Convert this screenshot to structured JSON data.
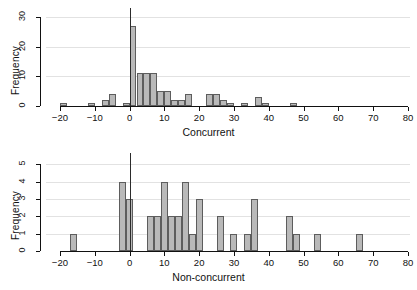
{
  "figure": {
    "title": "",
    "panels": [
      "concurrent",
      "non-concurrent"
    ]
  },
  "chart_data": [
    {
      "type": "bar",
      "subtype": "histogram",
      "title": "",
      "xlabel": "Concurrent",
      "ylabel": "Frequency",
      "xlim": [
        -24,
        80
      ],
      "ylim": [
        0,
        31
      ],
      "xticks": [
        -20,
        -10,
        0,
        10,
        20,
        30,
        40,
        50,
        60,
        70,
        80
      ],
      "yticks": [
        0,
        10,
        20,
        30
      ],
      "grid": "horizontal",
      "bin_width": 2,
      "bin_starts": [
        -20,
        -12,
        -8,
        -6,
        -2,
        0,
        2,
        4,
        6,
        8,
        10,
        12,
        14,
        16,
        22,
        24,
        26,
        28,
        32,
        36,
        38,
        46
      ],
      "values": [
        1,
        1,
        2,
        4,
        1,
        27,
        11,
        11,
        11,
        5,
        5,
        2,
        2,
        4,
        4,
        4,
        2,
        1,
        1,
        3,
        1,
        1
      ],
      "reference_line_x": 0,
      "legend": "none"
    },
    {
      "type": "bar",
      "subtype": "histogram",
      "title": "",
      "xlabel": "Non-concurrent",
      "ylabel": "Frequency",
      "xlim": [
        -24,
        80
      ],
      "ylim": [
        0,
        5.3
      ],
      "xticks": [
        -20,
        -10,
        0,
        10,
        20,
        30,
        40,
        50,
        60,
        70,
        80
      ],
      "yticks": [
        0,
        1,
        2,
        3,
        4,
        5
      ],
      "grid": "horizontal",
      "bin_width": 2,
      "bin_starts": [
        -17,
        -3,
        -1,
        5,
        7,
        9,
        11,
        13,
        15,
        17,
        19,
        25,
        29,
        33,
        35,
        45,
        47,
        53,
        65
      ],
      "values": [
        1,
        4,
        3,
        2,
        2,
        4,
        2,
        2,
        4,
        1,
        3,
        2,
        1,
        1,
        3,
        2,
        1,
        1,
        1
      ],
      "reference_line_x": 0,
      "legend": "none"
    }
  ]
}
